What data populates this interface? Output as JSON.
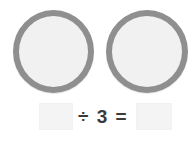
{
  "worksheet": {
    "type": "division-model",
    "background_color": "#ffffff",
    "groups": {
      "count": 2,
      "items": [
        {
          "name": "group-circle-left",
          "contents_label": "",
          "item_count": 0,
          "border_color": "#8f8f8f",
          "fill_color": "#f1f1f1"
        },
        {
          "name": "group-circle-right",
          "contents_label": "",
          "item_count": 0,
          "border_color": "#8f8f8f",
          "fill_color": "#f1f1f1"
        }
      ]
    },
    "equation": {
      "dividend_value": "",
      "dividend_placeholder": "",
      "operator_text": "÷ 3 =",
      "divisor": 3,
      "quotient_value": "",
      "quotient_placeholder": "",
      "text_color": "#3b3b3b",
      "box_fill_color": "#f4f4f4"
    }
  }
}
